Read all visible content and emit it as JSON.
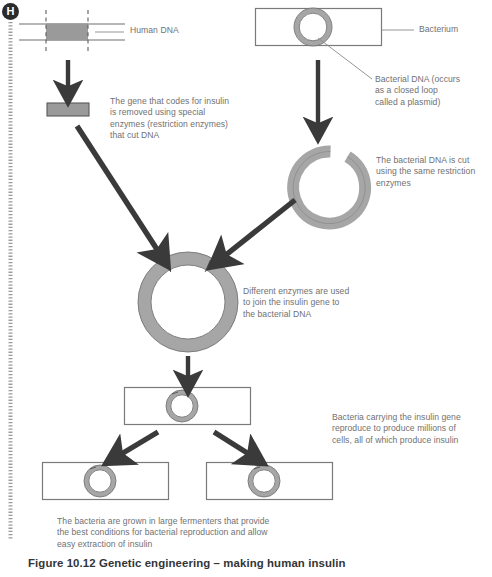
{
  "figure": {
    "badge": "H",
    "caption": "Figure 10.12 Genetic engineering – making human insulin"
  },
  "labels": {
    "human_dna": "Human DNA",
    "bacterium": "Bacterium",
    "bacterial_dna": "Bacterial DNA (occurs\nas a closed loop\ncalled a plasmid)",
    "gene_removed": "The gene that codes for insulin\nis removed using special\nenzymes (restriction enzymes)\nthat cut DNA",
    "dna_cut": "The bacterial DNA is cut\nusing the same restriction\nenzymes",
    "join_gene": "Different enzymes are used\nto join the insulin gene to\nthe bacterial DNA",
    "reproduce": "Bacteria carrying the insulin gene\nreproduce to produce millions of\ncells, all of which produce insulin",
    "fermenters": "The bacteria are grown in large fermenters that provide\nthe best conditions for bacterial reproduction and allow\neasy extraction of insulin"
  },
  "colors": {
    "gene_fill": "#9a9a9a",
    "gene_stroke": "#5a5a5a",
    "plasmid_fill": "#a6a6a6",
    "plasmid_stroke": "#6e6e6e",
    "arrow": "#3a3a3a",
    "outline": "#7a7a7a",
    "leader": "#8a8a8a",
    "text": "#6f7173",
    "caption_text": "#333537",
    "badge_bg": "#2b2b2b",
    "margin_rule": "#9b9b9b"
  },
  "diagram": {
    "type": "process-flow",
    "title": "Genetic engineering – making human insulin",
    "steps": [
      "Human DNA containing the insulin gene is cut at two points",
      "The insulin gene is excised",
      "A bacterium contains bacterial DNA as a closed-loop plasmid",
      "The plasmid is cut open with the same restriction enzymes",
      "The insulin gene is joined into the opened plasmid",
      "The recombinant plasmid is put back into a bacterium",
      "The bacterium reproduces into millions of insulin-producing cells"
    ]
  }
}
